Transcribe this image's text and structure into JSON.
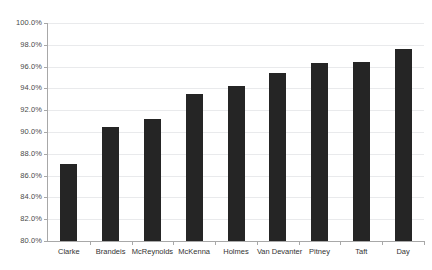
{
  "chart_data": {
    "type": "bar",
    "title": "",
    "subtitle": "",
    "xlabel": "",
    "ylabel": "",
    "categories": [
      "Clarke",
      "Brandeis",
      "McReynolds",
      "McKenna",
      "Holmes",
      "Van Devanter",
      "Pitney",
      "Taft",
      "Day"
    ],
    "values": [
      87.1,
      90.5,
      91.2,
      93.5,
      94.2,
      95.4,
      96.3,
      96.4,
      97.6
    ],
    "value_labels": [
      "87.1%",
      "90.5%",
      "91.2%",
      "93.5%",
      "94.2%",
      "95.4%",
      "96.3%",
      "96.4%",
      "97.6%"
    ],
    "ylim": [
      80.0,
      100.0
    ],
    "ytick_values": [
      100.0,
      98.0,
      96.0,
      94.0,
      92.0,
      90.0,
      88.0,
      86.0,
      84.0,
      82.0,
      80.0
    ],
    "ytick_labels": [
      "100.0%",
      "98.0%",
      "96.0%",
      "94.0%",
      "92.0%",
      "90.0%",
      "88.0%",
      "86.0%",
      "84.0%",
      "82.0%",
      "80.0%"
    ],
    "grid": true,
    "grid_orientation": "horizontal",
    "legend": false,
    "legend_position": "none",
    "series": [
      {
        "name": "",
        "values": [
          87.1,
          90.5,
          91.2,
          93.5,
          94.2,
          95.4,
          96.3,
          96.4,
          97.6
        ]
      }
    ],
    "colors": {
      "bar": "#252525",
      "grid": "#e9eaec",
      "axis": "#a8a8a8",
      "tick_label": "#4a4a4a",
      "category_label": "#333333",
      "background": "#ffffff"
    }
  }
}
